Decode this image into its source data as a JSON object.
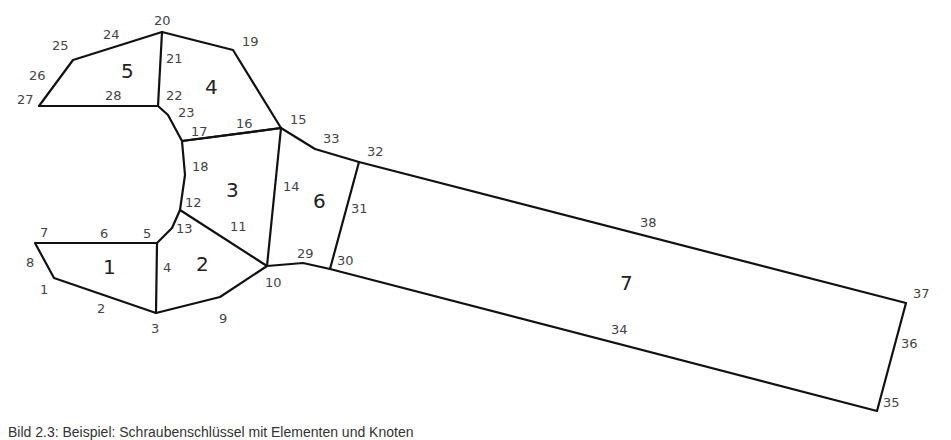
{
  "figure": {
    "caption": "Bild 2.3: Beispiel: Schraubenschlüssel mit Elementen und Knoten",
    "stroke_color": "#111111",
    "label_color": "#444444"
  },
  "elements": [
    {
      "id": "1",
      "label": "1",
      "x": 103,
      "y": 274
    },
    {
      "id": "2",
      "label": "2",
      "x": 196,
      "y": 271
    },
    {
      "id": "3",
      "label": "3",
      "x": 226,
      "y": 197
    },
    {
      "id": "4",
      "label": "4",
      "x": 205,
      "y": 94
    },
    {
      "id": "5",
      "label": "5",
      "x": 121,
      "y": 78
    },
    {
      "id": "6",
      "label": "6",
      "x": 313,
      "y": 208
    },
    {
      "id": "7",
      "label": "7",
      "x": 620,
      "y": 290
    }
  ],
  "nodes": [
    {
      "label": "1",
      "x": 40,
      "y": 294
    },
    {
      "label": "2",
      "x": 97,
      "y": 313
    },
    {
      "label": "3",
      "x": 151,
      "y": 333
    },
    {
      "label": "4",
      "x": 163,
      "y": 272
    },
    {
      "label": "5",
      "x": 143,
      "y": 238
    },
    {
      "label": "6",
      "x": 100,
      "y": 238
    },
    {
      "label": "7",
      "x": 40,
      "y": 237
    },
    {
      "label": "8",
      "x": 26,
      "y": 267
    },
    {
      "label": "9",
      "x": 219,
      "y": 323
    },
    {
      "label": "10",
      "x": 265,
      "y": 287
    },
    {
      "label": "11",
      "x": 230,
      "y": 231
    },
    {
      "label": "12",
      "x": 185,
      "y": 207
    },
    {
      "label": "13",
      "x": 176,
      "y": 233
    },
    {
      "label": "14",
      "x": 283,
      "y": 191
    },
    {
      "label": "15",
      "x": 290,
      "y": 124
    },
    {
      "label": "16",
      "x": 236,
      "y": 128
    },
    {
      "label": "17",
      "x": 191,
      "y": 136
    },
    {
      "label": "18",
      "x": 192,
      "y": 171
    },
    {
      "label": "19",
      "x": 242,
      "y": 46
    },
    {
      "label": "20",
      "x": 154,
      "y": 25
    },
    {
      "label": "21",
      "x": 166,
      "y": 63
    },
    {
      "label": "22",
      "x": 166,
      "y": 100
    },
    {
      "label": "23",
      "x": 178,
      "y": 117
    },
    {
      "label": "24",
      "x": 103,
      "y": 39
    },
    {
      "label": "25",
      "x": 52,
      "y": 50
    },
    {
      "label": "26",
      "x": 29,
      "y": 80
    },
    {
      "label": "27",
      "x": 17,
      "y": 104
    },
    {
      "label": "28",
      "x": 105,
      "y": 100
    },
    {
      "label": "29",
      "x": 297,
      "y": 258
    },
    {
      "label": "30",
      "x": 337,
      "y": 265
    },
    {
      "label": "31",
      "x": 351,
      "y": 213
    },
    {
      "label": "32",
      "x": 367,
      "y": 156
    },
    {
      "label": "33",
      "x": 323,
      "y": 143
    },
    {
      "label": "34",
      "x": 611,
      "y": 334
    },
    {
      "label": "35",
      "x": 883,
      "y": 407
    },
    {
      "label": "36",
      "x": 901,
      "y": 348
    },
    {
      "label": "37",
      "x": 913,
      "y": 298
    },
    {
      "label": "38",
      "x": 640,
      "y": 227
    }
  ],
  "edges": [
    {
      "name": "outline-element-1",
      "points": "35,243 157,243 156,313 54,278 35,243"
    },
    {
      "name": "outline-element-2",
      "points": "157,243 172,228 180,210 267,266 220,297 156,313"
    },
    {
      "name": "outline-element-3",
      "points": "180,210 185,175 182,141 281,128 267,266"
    },
    {
      "name": "outline-element-4",
      "points": "162,32 233,50 281,128 182,141 168,115 158,106 162,32"
    },
    {
      "name": "outline-element-5",
      "points": "162,32 73,60 39,106 158,106"
    },
    {
      "name": "outline-element-6",
      "points": "281,128 315,149 359,162 330,269 303,263 267,266"
    },
    {
      "name": "outline-element-7",
      "points": "359,162 906,303 877,411 330,269"
    }
  ]
}
